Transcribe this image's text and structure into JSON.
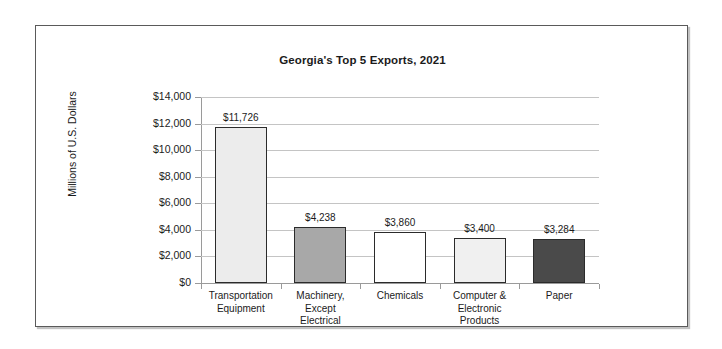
{
  "chart_data": {
    "type": "bar",
    "title": "Georgia's Top 5 Exports, 2021",
    "xlabel": "",
    "ylabel": "Millions of U.S. Dollars",
    "ylim": [
      0,
      14000
    ],
    "ytick_step": 2000,
    "grid": true,
    "legend": "none",
    "categories": [
      "Transportation Equipment",
      "Machinery, Except Electrical",
      "Chemicals",
      "Computer & Electronic Products",
      "Paper"
    ],
    "category_lines": [
      [
        "Transportation",
        "Equipment"
      ],
      [
        "Machinery,",
        "Except",
        "Electrical"
      ],
      [
        "Chemicals"
      ],
      [
        "Computer &",
        "Electronic",
        "Products"
      ],
      [
        "Paper"
      ]
    ],
    "values": [
      11726,
      4238,
      3860,
      3400,
      3284
    ],
    "value_labels": [
      "$11,726",
      "$4,238",
      "$3,860",
      "$3,400",
      "$3,284"
    ],
    "bar_colors": [
      "#ececec",
      "#a8a8a8",
      "#ffffff",
      "#f0f0f0",
      "#4a4a4a"
    ],
    "bar_border_color": "#2b2b2b",
    "ytick_labels": [
      "$14,000",
      "$12,000",
      "$10,000",
      "$8,000",
      "$6,000",
      "$4,000",
      "$2,000",
      "$0"
    ],
    "ytick_values": [
      14000,
      12000,
      10000,
      8000,
      6000,
      4000,
      2000,
      0
    ]
  },
  "style": {
    "gridline_color": "#c4c4c4",
    "axis_color": "#9a9a9a",
    "text_color": "#1b1b1b",
    "frame_color": "#5a5a5a",
    "background": "#ffffff"
  }
}
